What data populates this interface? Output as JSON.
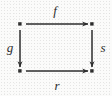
{
  "diagram": {
    "type": "commutative-square",
    "background_color": "#fbfbfa",
    "stroke_color": "#2b2b2b",
    "canvas": {
      "width": 112,
      "height": 96
    },
    "vertices": [
      {
        "id": "top-left",
        "label": "",
        "x": 20,
        "y": 24
      },
      {
        "id": "top-right",
        "label": "",
        "x": 92,
        "y": 24
      },
      {
        "id": "bottom-left",
        "label": "",
        "x": 20,
        "y": 71
      },
      {
        "id": "bottom-right",
        "label": "",
        "x": 92,
        "y": 71
      }
    ],
    "edges": [
      {
        "id": "edge-f",
        "label": "f",
        "from": "top-left",
        "to": "top-right",
        "direction": "right",
        "label_x": 55,
        "label_y": 10
      },
      {
        "id": "edge-g",
        "label": "g",
        "from": "top-left",
        "to": "bottom-left",
        "direction": "down",
        "label_x": 10,
        "label_y": 47
      },
      {
        "id": "edge-s",
        "label": "s",
        "from": "top-right",
        "to": "bottom-right",
        "direction": "down",
        "label_x": 103,
        "label_y": 47
      },
      {
        "id": "edge-r",
        "label": "r",
        "from": "bottom-left",
        "to": "bottom-right",
        "direction": "right",
        "label_x": 57,
        "label_y": 85
      }
    ]
  }
}
